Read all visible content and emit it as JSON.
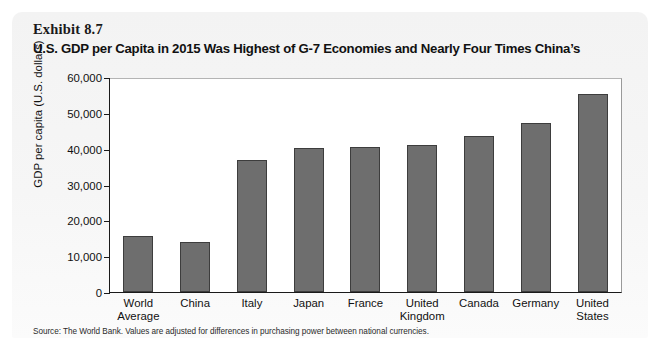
{
  "exhibit": {
    "label": "Exhibit 8.7",
    "title": "U.S. GDP per Capita in 2015 Was Highest of G-7 Economies and Nearly Four Times China’s",
    "source": "Source: The World Bank. Values are adjusted for differences in purchasing power between national currencies."
  },
  "colors": {
    "bar_fill": "#6e6e6e",
    "bar_stroke": "#3d3d3d",
    "panel_bg": "#f4f4f4",
    "plot_bg": "#ffffff",
    "axis": "#1a1a1a",
    "text": "#111111"
  },
  "chart_data": {
    "type": "bar",
    "title": "U.S. GDP per Capita in 2015 Was Highest of G-7 Economies and Nearly Four Times China’s",
    "xlabel": "",
    "ylabel": "GDP per capita (U.S. dollars)",
    "ylim": [
      0,
      60000
    ],
    "ytick_values": [
      0,
      10000,
      20000,
      30000,
      40000,
      50000,
      60000
    ],
    "ytick_labels": [
      "0",
      "10,000",
      "20,000",
      "30,000",
      "40,000",
      "50,000",
      "60,000"
    ],
    "grid": false,
    "legend": "none",
    "categories": [
      "World\nAverage",
      "China",
      "Italy",
      "Japan",
      "France",
      "United\nKingdom",
      "Canada",
      "Germany",
      "United\nStates"
    ],
    "category_lines": [
      [
        "World",
        "Average"
      ],
      [
        "China",
        ""
      ],
      [
        "Italy",
        ""
      ],
      [
        "Japan",
        ""
      ],
      [
        "France",
        ""
      ],
      [
        "United",
        "Kingdom"
      ],
      [
        "Canada",
        ""
      ],
      [
        "Germany",
        ""
      ],
      [
        "United",
        "States"
      ]
    ],
    "values": [
      15600,
      14000,
      37000,
      40500,
      40700,
      41300,
      43800,
      47400,
      55500
    ],
    "units": "U.S. dollars (PPP-adjusted)",
    "year": 2015,
    "source": "The World Bank"
  }
}
